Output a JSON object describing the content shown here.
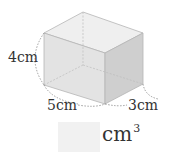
{
  "figure": {
    "shape": "rectangular-prism",
    "dimensions": {
      "height_label": "4cm",
      "width_label": "5cm",
      "depth_label": "3cm"
    },
    "colors": {
      "top_face": "#efefef",
      "front_face": "#e3e3e3",
      "side_face": "#cfcfcf",
      "edge": "#b5b5b5",
      "dim_line": "#777777"
    }
  },
  "answer": {
    "value": "",
    "unit": "cm",
    "unit_exponent": "3"
  }
}
